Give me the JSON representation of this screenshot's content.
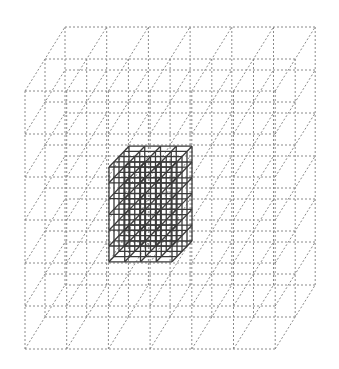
{
  "diagram": {
    "background": "#ffffff",
    "outer_grid": {
      "style": "dotted",
      "color": "#8a8a8a",
      "origin": [
        25,
        91
      ],
      "cols": 6,
      "rows": 6,
      "depth": 2,
      "cell_w": 41.7,
      "cell_h": 43,
      "depth_step": [
        20,
        -32
      ]
    },
    "inner_grid": {
      "style": "solid",
      "color": "#3a3a3a",
      "origin": [
        109,
        167
      ],
      "cols": 4,
      "rows": 6,
      "depth": 4,
      "cell_w": 15.75,
      "cell_h": 15.8,
      "depth_step": [
        5,
        -5.2
      ]
    }
  }
}
